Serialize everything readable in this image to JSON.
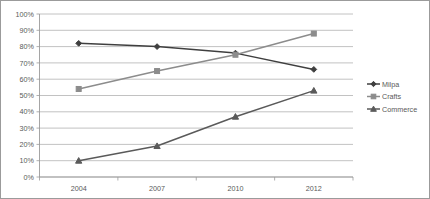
{
  "chart_data": {
    "type": "line",
    "title": "",
    "subtitle": "",
    "xlabel": "",
    "ylabel": "",
    "categories": [
      "2004",
      "2007",
      "2010",
      "2012"
    ],
    "ylim": [
      0,
      100
    ],
    "yticks": [
      "0%",
      "10%",
      "20%",
      "30%",
      "40%",
      "50%",
      "60%",
      "70%",
      "80%",
      "90%",
      "100%"
    ],
    "ytick_values": [
      0,
      10,
      20,
      30,
      40,
      50,
      60,
      70,
      80,
      90,
      100
    ],
    "grid": true,
    "legend_position": "right",
    "value_suffix": "%",
    "series": [
      {
        "name": "Milpa",
        "marker": "diamond",
        "color": "#3f3f3f",
        "values": [
          82,
          80,
          76,
          66
        ]
      },
      {
        "name": "Crafts",
        "marker": "square",
        "color": "#8c8c8c",
        "values": [
          54,
          65,
          75,
          88
        ]
      },
      {
        "name": "Commerce",
        "marker": "triangle",
        "color": "#5a5a5a",
        "values": [
          10,
          19,
          37,
          53
        ]
      }
    ]
  },
  "legend": {
    "items": [
      {
        "label": "Milpa",
        "marker": "diamond-marker-icon",
        "color": "#3f3f3f"
      },
      {
        "label": "Crafts",
        "marker": "square-marker-icon",
        "color": "#8c8c8c"
      },
      {
        "label": "Commerce",
        "marker": "triangle-marker-icon",
        "color": "#5a5a5a"
      }
    ]
  },
  "colors": {
    "plot_background": "#ffffff",
    "gridline": "#b3b3b3",
    "axis": "#9b9b9b",
    "tick_text": "#595959",
    "frame_border": "#9b9b9b"
  }
}
